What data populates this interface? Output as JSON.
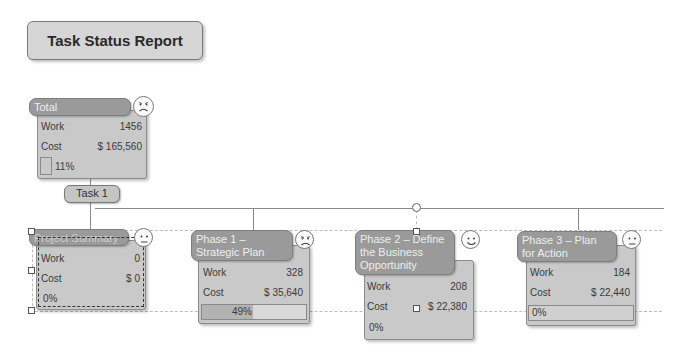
{
  "title": "Task Status Report",
  "task_pill": "Task  1",
  "nodes": [
    {
      "header": "Total",
      "work_label": "Work",
      "work": "1456",
      "cost_label": "Cost",
      "cost": "$ 165,560",
      "percent": "11%",
      "face": "sad"
    },
    {
      "header": "Project Summary",
      "work_label": "Work",
      "work": "0",
      "cost_label": "Cost",
      "cost": "$ 0",
      "percent": "0%",
      "face": "neutral"
    },
    {
      "header": "Phase 1 – Strategic Plan",
      "work_label": "Work",
      "work": "328",
      "cost_label": "Cost",
      "cost": "$ 35,640",
      "percent": "49%",
      "face": "sad"
    },
    {
      "header": "Phase 2 – Define the Business Opportunity",
      "work_label": "Work",
      "work": "208",
      "cost_label": "Cost",
      "cost": "$ 22,380",
      "percent": "0%",
      "face": "happy"
    },
    {
      "header": "Phase 3 – Plan for Action",
      "work_label": "Work",
      "work": "184",
      "cost_label": "Cost",
      "cost": "$ 22,440",
      "percent": "0%",
      "face": "neutral"
    }
  ]
}
